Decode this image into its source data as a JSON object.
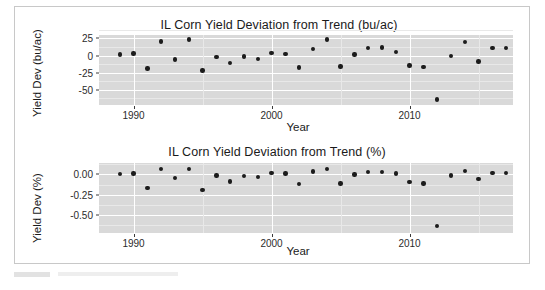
{
  "chart_data": [
    {
      "type": "scatter",
      "title": "IL Corn Yield Deviation from Trend (bu/ac)",
      "xlabel": "Year",
      "ylabel": "Yield Dev (bu/ac)",
      "xlim": [
        1987.5,
        2017.5
      ],
      "ylim": [
        -72,
        30
      ],
      "xticks": [
        1990,
        2000,
        2010
      ],
      "xtick_labels": [
        "1990",
        "2000",
        "2010"
      ],
      "yticks": [
        25,
        0,
        -25,
        -50
      ],
      "ytick_labels": [
        "25",
        "0",
        "-25",
        "-50"
      ],
      "grid": true,
      "legend": "none",
      "point_color": "#1c1c1c",
      "panel_color": "#d9d9d9",
      "gridline_color": "#ffffff",
      "x": [
        1989,
        1990,
        1991,
        1992,
        1993,
        1994,
        1995,
        1996,
        1997,
        1998,
        1999,
        2000,
        2001,
        2002,
        2003,
        2004,
        2005,
        2006,
        2007,
        2008,
        2009,
        2010,
        2011,
        2012,
        2013,
        2014,
        2015,
        2016,
        2017
      ],
      "values": [
        1.5,
        3.0,
        -19.0,
        20.5,
        -5.5,
        23.5,
        -22.0,
        -2.0,
        -11.0,
        -1.5,
        -5.0,
        4.0,
        2.5,
        -17.5,
        9.5,
        23.5,
        -16.0,
        1.5,
        11.5,
        12.0,
        5.5,
        -14.5,
        -17.0,
        -64.0,
        -0.5,
        19.5,
        -8.5,
        11.5,
        11.0
      ]
    },
    {
      "type": "scatter",
      "title": "IL Corn Yield Deviation from Trend (%)",
      "xlabel": "Year",
      "ylabel": "Yield Dev (%)",
      "xlim": [
        1987.5,
        2017.5
      ],
      "ylim": [
        -0.72,
        0.14
      ],
      "xticks": [
        1990,
        2000,
        2010
      ],
      "xtick_labels": [
        "1990",
        "2000",
        "2010"
      ],
      "yticks": [
        0.0,
        -0.25,
        -0.5
      ],
      "ytick_labels": [
        "0.00",
        "-0.25",
        "-0.50"
      ],
      "grid": true,
      "legend": "none",
      "point_color": "#1c1c1c",
      "panel_color": "#d9d9d9",
      "gridline_color": "#ffffff",
      "x": [
        1989,
        1990,
        1991,
        1992,
        1993,
        1994,
        1995,
        1996,
        1997,
        1998,
        1999,
        2000,
        2001,
        2002,
        2003,
        2004,
        2005,
        2006,
        2007,
        2008,
        2009,
        2010,
        2011,
        2012,
        2013,
        2014,
        2015,
        2016,
        2017
      ],
      "values": [
        0.005,
        0.01,
        -0.165,
        0.065,
        -0.045,
        0.07,
        -0.19,
        -0.015,
        -0.085,
        -0.02,
        -0.035,
        0.015,
        0.01,
        -0.12,
        0.035,
        0.065,
        -0.11,
        0.0,
        0.03,
        0.03,
        0.01,
        -0.095,
        -0.11,
        -0.635,
        -0.015,
        0.045,
        -0.06,
        0.02,
        0.015
      ]
    }
  ]
}
